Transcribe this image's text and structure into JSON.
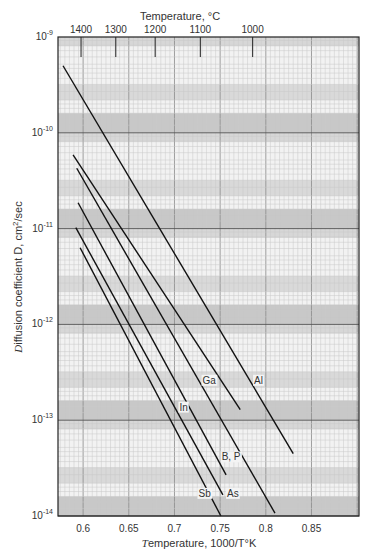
{
  "chart_data": {
    "type": "line",
    "title": "",
    "xlabel": "Temperature, 1000/T°K",
    "ylabel": "Diffusion coefficient D, cm²/sec",
    "top_axis_label": "Temperature, °C",
    "xlim": [
      0.5725,
      0.902
    ],
    "ylim_log10": [
      -14,
      -9
    ],
    "yscale": "log",
    "grid": true,
    "x_ticks": [
      0.6,
      0.65,
      0.7,
      0.75,
      0.8,
      0.85
    ],
    "x_tick_labels": [
      "0.6",
      "0.65",
      "0.7",
      "0.75",
      "0.8",
      "0.85"
    ],
    "y_ticks_log10": [
      -9,
      -10,
      -11,
      -12,
      -13,
      -14
    ],
    "y_tick_labels": [
      "10",
      "10",
      "10",
      "10",
      "10",
      "10"
    ],
    "y_tick_exponents": [
      "-9",
      "-10",
      "-11",
      "-12",
      "-13",
      "-14"
    ],
    "top_ticks_celsius": [
      1400,
      1300,
      1200,
      1100,
      1000
    ],
    "top_tick_labels": [
      "1400",
      "1300",
      "1200",
      "1100",
      "1000"
    ],
    "series": [
      {
        "name": "Al",
        "x": [
          0.578,
          0.83
        ],
        "log10_D": [
          -9.3,
          -13.35
        ],
        "label_pos": [
          0.792,
          -12.62
        ]
      },
      {
        "name": "Ga",
        "x": [
          0.589,
          0.772
        ],
        "log10_D": [
          -10.23,
          -12.89
        ],
        "label_pos": [
          0.738,
          -12.62
        ]
      },
      {
        "name": "B, P",
        "x": [
          0.593,
          0.81
        ],
        "log10_D": [
          -10.37,
          -13.97
        ],
        "label_pos": [
          0.762,
          -13.42
        ]
      },
      {
        "name": "In",
        "x": [
          0.5945,
          0.7565
        ],
        "log10_D": [
          -10.73,
          -13.57
        ],
        "label_pos": [
          0.71,
          -12.9
        ]
      },
      {
        "name": "As",
        "x": [
          0.592,
          0.753
        ],
        "log10_D": [
          -10.99,
          -13.78
        ],
        "label_pos": [
          0.764,
          -13.8
        ]
      },
      {
        "name": "Sb",
        "x": [
          0.5967,
          0.7508
        ],
        "log10_D": [
          -11.2,
          -14.0
        ],
        "label_pos": [
          0.733,
          -13.8
        ]
      }
    ]
  },
  "colors": {
    "line": "#111111",
    "frame": "#222222",
    "grid_minor": "#c8c8c8",
    "grid_major": "#8a8a8a",
    "band_dark": "#bdbdbd",
    "band_light": "#f2f2f2"
  }
}
